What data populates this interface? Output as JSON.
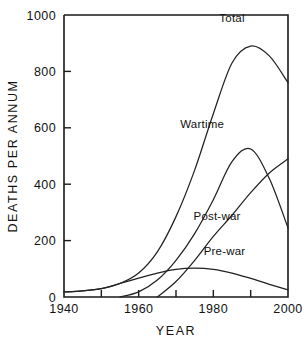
{
  "chart_data": {
    "type": "line",
    "title": "",
    "xlabel": "YEAR",
    "ylabel": "DEATHS PER ANNUM",
    "xlim": [
      1940,
      2000
    ],
    "ylim": [
      0,
      1000
    ],
    "grid": false,
    "legend_position": "inline-labels",
    "xticks": [
      1940,
      1950,
      1960,
      1970,
      1980,
      1990,
      2000
    ],
    "xtick_labels": [
      "1940",
      "",
      "1960",
      "",
      "1980",
      "",
      "2000"
    ],
    "yticks": [
      0,
      200,
      400,
      600,
      800,
      1000
    ],
    "ytick_labels": [
      "0",
      "200",
      "400",
      "600",
      "800",
      "1000"
    ],
    "x": [
      1940,
      1945,
      1950,
      1955,
      1960,
      1965,
      1970,
      1975,
      1980,
      1985,
      1990,
      1995,
      2000
    ],
    "series": [
      {
        "name": "Total",
        "label": "Total",
        "values": [
          18,
          22,
          30,
          48,
          85,
          160,
          285,
          450,
          650,
          830,
          890,
          855,
          760
        ]
      },
      {
        "name": "Wartime",
        "label": "Wartime",
        "values": [
          0,
          0,
          0,
          0,
          18,
          60,
          130,
          225,
          345,
          480,
          525,
          420,
          245
        ]
      },
      {
        "name": "Post-war",
        "label": "Post-war",
        "values": [
          0,
          0,
          0,
          0,
          0,
          0,
          55,
          130,
          215,
          290,
          370,
          440,
          490
        ]
      },
      {
        "name": "Pre-war",
        "label": "Pre-war",
        "values": [
          18,
          22,
          30,
          48,
          67,
          85,
          98,
          102,
          98,
          85,
          66,
          45,
          25
        ]
      }
    ],
    "series_label_positions": [
      {
        "name": "Total",
        "x": 1985,
        "y": 975
      },
      {
        "name": "Wartime",
        "x": 1977,
        "y": 600
      },
      {
        "name": "Post-war",
        "x": 1981,
        "y": 272
      },
      {
        "name": "Pre-war",
        "x": 1983,
        "y": 148
      }
    ]
  },
  "colors": {
    "ink": "#1a1a1a",
    "line": "#222222",
    "background": "#ffffff"
  }
}
